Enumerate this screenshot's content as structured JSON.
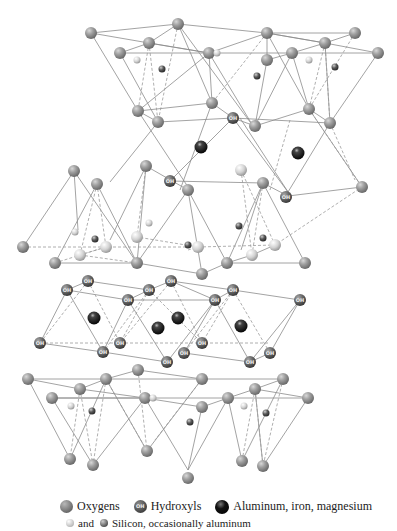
{
  "figure": {
    "colors": {
      "oxygen": "#9a9a9a",
      "hydroxyl": "#5a5a5a",
      "cation_octahedral": "#111111",
      "silicon_light": "#e6e6e6",
      "silicon_dark": "#444444",
      "bond_line": "#8c8c8c"
    }
  },
  "atom_labels": {
    "hydroxyl": "OH"
  },
  "legend": {
    "oxygens": "Oxygens",
    "hydroxyls": "Hydroxyls",
    "hydroxyl_icon_text": "OH",
    "aluminum": "Aluminum, iron, magnesium",
    "and": "and",
    "silicon": "Silicon, occasionally aluminum"
  }
}
